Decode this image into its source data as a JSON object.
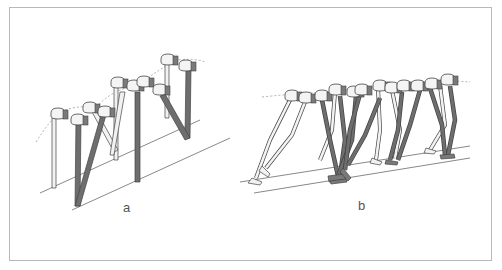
{
  "figure": {
    "panels": [
      {
        "id": "a",
        "label": "a",
        "description": "Stick-figure sequence of biped legs with hip blocks, stiff-legged (compass) gait along inclined ground lines"
      },
      {
        "id": "b",
        "label": "b",
        "description": "Stick-figure sequence of biped legs with knees and feet, bent-knee walking gait along inclined ground lines"
      }
    ]
  },
  "colors": {
    "frame": "#b8b8b8",
    "line": "#444444",
    "leg_dark": "#6e6e6e",
    "leg_light": "#f2f2f2",
    "hip_dark": "#7a7a7a",
    "dashed_path": "#9a9a9a",
    "label": "#555555"
  }
}
